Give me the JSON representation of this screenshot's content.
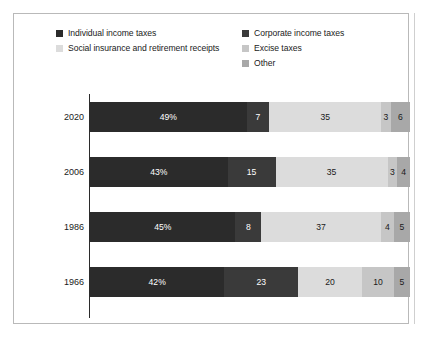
{
  "legend": {
    "items": [
      {
        "label": "Individual income taxes",
        "key": "individual",
        "color": "#2b2b2b",
        "column": 1
      },
      {
        "label": "Corporate income taxes",
        "key": "corporate",
        "color": "#3a3a3a",
        "column": 2
      },
      {
        "label": "Social insurance and retirement receipts",
        "key": "social",
        "color": "#dcdcdc",
        "column": 1
      },
      {
        "label": "Excise taxes",
        "key": "excise",
        "color": "#c6c6c6",
        "column": 2
      },
      {
        "label": "Other",
        "key": "other",
        "color": "#a8a8a8",
        "column": 2
      }
    ]
  },
  "chart_data": {
    "type": "bar",
    "orientation": "horizontal",
    "stacked": true,
    "normalized_percent": true,
    "title": "",
    "subtitle": "",
    "xlabel": "",
    "ylabel": "",
    "xlim": [
      0,
      100
    ],
    "grid": false,
    "legend_position": "top",
    "categories": [
      "2020",
      "2006",
      "1986",
      "1966"
    ],
    "series": [
      {
        "name": "Individual income taxes",
        "color": "#2b2b2b",
        "values": [
          49,
          43,
          45,
          42
        ]
      },
      {
        "name": "Corporate income taxes",
        "color": "#3a3a3a",
        "values": [
          7,
          15,
          8,
          23
        ]
      },
      {
        "name": "Social insurance and retirement receipts",
        "color": "#dcdcdc",
        "values": [
          35,
          35,
          37,
          20
        ]
      },
      {
        "name": "Excise taxes",
        "color": "#c6c6c6",
        "values": [
          3,
          3,
          4,
          10
        ]
      },
      {
        "name": "Other",
        "color": "#a8a8a8",
        "values": [
          6,
          4,
          5,
          5
        ]
      }
    ],
    "rows": [
      {
        "year": "2020",
        "segments": [
          {
            "key": "individual",
            "label": "49%",
            "value": 49,
            "color": "#2b2b2b",
            "tone": "dark"
          },
          {
            "key": "corporate",
            "label": "7",
            "value": 7,
            "color": "#3a3a3a",
            "tone": "dark"
          },
          {
            "key": "social",
            "label": "35",
            "value": 35,
            "color": "#dcdcdc",
            "tone": "light"
          },
          {
            "key": "excise",
            "label": "3",
            "value": 3,
            "color": "#c6c6c6",
            "tone": "light"
          },
          {
            "key": "other",
            "label": "6",
            "value": 6,
            "color": "#a8a8a8",
            "tone": "light"
          }
        ]
      },
      {
        "year": "2006",
        "segments": [
          {
            "key": "individual",
            "label": "43%",
            "value": 43,
            "color": "#2b2b2b",
            "tone": "dark"
          },
          {
            "key": "corporate",
            "label": "15",
            "value": 15,
            "color": "#3a3a3a",
            "tone": "dark"
          },
          {
            "key": "social",
            "label": "35",
            "value": 35,
            "color": "#dcdcdc",
            "tone": "light"
          },
          {
            "key": "excise",
            "label": "3",
            "value": 3,
            "color": "#c6c6c6",
            "tone": "light"
          },
          {
            "key": "other",
            "label": "4",
            "value": 4,
            "color": "#a8a8a8",
            "tone": "light"
          }
        ]
      },
      {
        "year": "1986",
        "segments": [
          {
            "key": "individual",
            "label": "45%",
            "value": 45,
            "color": "#2b2b2b",
            "tone": "dark"
          },
          {
            "key": "corporate",
            "label": "8",
            "value": 8,
            "color": "#3a3a3a",
            "tone": "dark"
          },
          {
            "key": "social",
            "label": "37",
            "value": 37,
            "color": "#dcdcdc",
            "tone": "light"
          },
          {
            "key": "excise",
            "label": "4",
            "value": 4,
            "color": "#c6c6c6",
            "tone": "light"
          },
          {
            "key": "other",
            "label": "5",
            "value": 5,
            "color": "#a8a8a8",
            "tone": "light"
          }
        ]
      },
      {
        "year": "1966",
        "segments": [
          {
            "key": "individual",
            "label": "42%",
            "value": 42,
            "color": "#2b2b2b",
            "tone": "dark"
          },
          {
            "key": "corporate",
            "label": "23",
            "value": 23,
            "color": "#3a3a3a",
            "tone": "dark"
          },
          {
            "key": "social",
            "label": "20",
            "value": 20,
            "color": "#dcdcdc",
            "tone": "light"
          },
          {
            "key": "excise",
            "label": "10",
            "value": 10,
            "color": "#c6c6c6",
            "tone": "light"
          },
          {
            "key": "other",
            "label": "5",
            "value": 5,
            "color": "#a8a8a8",
            "tone": "light"
          }
        ]
      }
    ]
  }
}
